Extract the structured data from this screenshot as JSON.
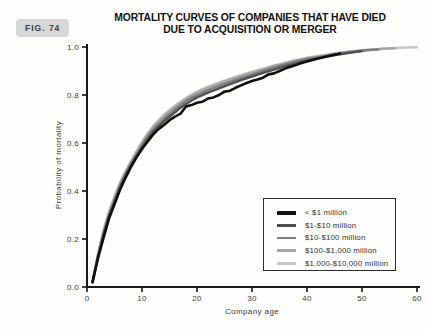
{
  "figure": {
    "badge": "FIG. 74"
  },
  "title": {
    "line1": "MORTALITY CURVES OF COMPANIES THAT HAVE DIED",
    "line2": "DUE TO ACQUISITION OR MERGER"
  },
  "chart_data": {
    "type": "line",
    "title": "MORTALITY CURVES OF COMPANIES THAT HAVE DIED DUE TO ACQUISITION OR MERGER",
    "xlabel": "Company age",
    "ylabel": "Probability of mortality",
    "xlim": [
      0,
      60
    ],
    "ylim": [
      0.0,
      1.0
    ],
    "x_ticks": [
      0,
      10,
      20,
      30,
      40,
      50,
      60
    ],
    "y_tick_labels": [
      "0.0",
      "0.2",
      "0.4",
      "0.6",
      "0.8",
      "1.0"
    ],
    "grid": false,
    "legend_position": "lower right",
    "axis_color": "#1a1a1a",
    "series": [
      {
        "name": "< $1 million",
        "color": "#101010",
        "line_width": 2.6,
        "points": [
          [
            1,
            0.02
          ],
          [
            2,
            0.12
          ],
          [
            3,
            0.205
          ],
          [
            4,
            0.285
          ],
          [
            5,
            0.345
          ],
          [
            6,
            0.405
          ],
          [
            7,
            0.455
          ],
          [
            8,
            0.5
          ],
          [
            9,
            0.54
          ],
          [
            10,
            0.575
          ],
          [
            11,
            0.605
          ],
          [
            12,
            0.635
          ],
          [
            13,
            0.658
          ],
          [
            14,
            0.675
          ],
          [
            15,
            0.695
          ],
          [
            16,
            0.71
          ],
          [
            17,
            0.722
          ],
          [
            18,
            0.752
          ],
          [
            19,
            0.758
          ],
          [
            20,
            0.768
          ],
          [
            21,
            0.772
          ],
          [
            22,
            0.785
          ],
          [
            23,
            0.79
          ],
          [
            24,
            0.8
          ],
          [
            25,
            0.814
          ],
          [
            26,
            0.818
          ],
          [
            27,
            0.83
          ],
          [
            28,
            0.84
          ],
          [
            29,
            0.85
          ],
          [
            30,
            0.858
          ],
          [
            31,
            0.864
          ],
          [
            32,
            0.872
          ],
          [
            33,
            0.886
          ],
          [
            34,
            0.89
          ],
          [
            35,
            0.9
          ],
          [
            36,
            0.91
          ],
          [
            37,
            0.918
          ],
          [
            38,
            0.925
          ],
          [
            39,
            0.933
          ],
          [
            40,
            0.94
          ],
          [
            41,
            0.946
          ],
          [
            42,
            0.952
          ],
          [
            43,
            0.957
          ],
          [
            44,
            0.962
          ],
          [
            45,
            0.968
          ],
          [
            46,
            0.973
          ]
        ]
      },
      {
        "name": "$1-$10 million",
        "color": "#4f4f4f",
        "line_width": 2.4,
        "points": [
          [
            1,
            0.02
          ],
          [
            2,
            0.125
          ],
          [
            3,
            0.215
          ],
          [
            4,
            0.295
          ],
          [
            5,
            0.355
          ],
          [
            6,
            0.415
          ],
          [
            7,
            0.465
          ],
          [
            8,
            0.508
          ],
          [
            9,
            0.546
          ],
          [
            10,
            0.582
          ],
          [
            11,
            0.615
          ],
          [
            12,
            0.645
          ],
          [
            13,
            0.668
          ],
          [
            14,
            0.69
          ],
          [
            15,
            0.71
          ],
          [
            16,
            0.728
          ],
          [
            17,
            0.747
          ],
          [
            18,
            0.763
          ],
          [
            19,
            0.777
          ],
          [
            20,
            0.79
          ],
          [
            22,
            0.81
          ],
          [
            24,
            0.828
          ],
          [
            26,
            0.845
          ],
          [
            28,
            0.862
          ],
          [
            30,
            0.877
          ],
          [
            32,
            0.892
          ],
          [
            34,
            0.906
          ],
          [
            36,
            0.92
          ],
          [
            38,
            0.932
          ],
          [
            40,
            0.943
          ],
          [
            42,
            0.953
          ],
          [
            44,
            0.962
          ],
          [
            46,
            0.97
          ],
          [
            48,
            0.977
          ],
          [
            50,
            0.983
          ]
        ]
      },
      {
        "name": "$10-$100 million",
        "color": "#7d7d7d",
        "line_width": 2.4,
        "points": [
          [
            1,
            0.02
          ],
          [
            2,
            0.13
          ],
          [
            3,
            0.225
          ],
          [
            4,
            0.3
          ],
          [
            5,
            0.36
          ],
          [
            6,
            0.42
          ],
          [
            7,
            0.47
          ],
          [
            8,
            0.512
          ],
          [
            9,
            0.552
          ],
          [
            10,
            0.59
          ],
          [
            11,
            0.625
          ],
          [
            12,
            0.655
          ],
          [
            13,
            0.678
          ],
          [
            14,
            0.7
          ],
          [
            15,
            0.72
          ],
          [
            16,
            0.74
          ],
          [
            17,
            0.758
          ],
          [
            18,
            0.775
          ],
          [
            19,
            0.788
          ],
          [
            20,
            0.8
          ],
          [
            22,
            0.82
          ],
          [
            24,
            0.838
          ],
          [
            26,
            0.855
          ],
          [
            28,
            0.87
          ],
          [
            30,
            0.885
          ],
          [
            32,
            0.9
          ],
          [
            34,
            0.915
          ],
          [
            36,
            0.928
          ],
          [
            38,
            0.94
          ],
          [
            40,
            0.95
          ],
          [
            42,
            0.958
          ],
          [
            44,
            0.965
          ],
          [
            46,
            0.972
          ],
          [
            48,
            0.978
          ],
          [
            50,
            0.984
          ],
          [
            52,
            0.988
          ],
          [
            53,
            0.99
          ]
        ]
      },
      {
        "name": "$100-$1,000 million",
        "color": "#a6a6a6",
        "line_width": 2.4,
        "points": [
          [
            1,
            0.02
          ],
          [
            2,
            0.135
          ],
          [
            3,
            0.23
          ],
          [
            4,
            0.31
          ],
          [
            5,
            0.372
          ],
          [
            6,
            0.43
          ],
          [
            7,
            0.478
          ],
          [
            8,
            0.52
          ],
          [
            9,
            0.56
          ],
          [
            10,
            0.6
          ],
          [
            11,
            0.634
          ],
          [
            12,
            0.665
          ],
          [
            13,
            0.69
          ],
          [
            14,
            0.712
          ],
          [
            15,
            0.732
          ],
          [
            16,
            0.75
          ],
          [
            17,
            0.767
          ],
          [
            18,
            0.783
          ],
          [
            19,
            0.797
          ],
          [
            20,
            0.81
          ],
          [
            22,
            0.83
          ],
          [
            24,
            0.848
          ],
          [
            26,
            0.864
          ],
          [
            28,
            0.879
          ],
          [
            30,
            0.893
          ],
          [
            32,
            0.907
          ],
          [
            34,
            0.92
          ],
          [
            36,
            0.932
          ],
          [
            38,
            0.943
          ],
          [
            40,
            0.953
          ],
          [
            42,
            0.961
          ],
          [
            44,
            0.968
          ],
          [
            46,
            0.975
          ],
          [
            48,
            0.981
          ],
          [
            50,
            0.986
          ],
          [
            52,
            0.99
          ],
          [
            54,
            0.993
          ],
          [
            56,
            0.995
          ]
        ]
      },
      {
        "name": "$1,000-$10,000 million",
        "color": "#c6c6c6",
        "line_width": 2.4,
        "points": [
          [
            1,
            0.02
          ],
          [
            2,
            0.14
          ],
          [
            3,
            0.238
          ],
          [
            4,
            0.315
          ],
          [
            5,
            0.378
          ],
          [
            6,
            0.435
          ],
          [
            7,
            0.483
          ],
          [
            8,
            0.525
          ],
          [
            9,
            0.566
          ],
          [
            10,
            0.605
          ],
          [
            11,
            0.64
          ],
          [
            12,
            0.67
          ],
          [
            13,
            0.695
          ],
          [
            14,
            0.718
          ],
          [
            15,
            0.738
          ],
          [
            16,
            0.755
          ],
          [
            17,
            0.772
          ],
          [
            18,
            0.788
          ],
          [
            19,
            0.802
          ],
          [
            20,
            0.815
          ],
          [
            22,
            0.835
          ],
          [
            24,
            0.852
          ],
          [
            26,
            0.868
          ],
          [
            28,
            0.883
          ],
          [
            30,
            0.897
          ],
          [
            32,
            0.91
          ],
          [
            34,
            0.923
          ],
          [
            36,
            0.935
          ],
          [
            38,
            0.946
          ],
          [
            40,
            0.955
          ],
          [
            42,
            0.963
          ],
          [
            44,
            0.97
          ],
          [
            46,
            0.977
          ],
          [
            48,
            0.982
          ],
          [
            50,
            0.987
          ],
          [
            52,
            0.99
          ],
          [
            54,
            0.993
          ],
          [
            56,
            0.996
          ],
          [
            58,
            0.998
          ],
          [
            60,
            0.999
          ]
        ]
      }
    ]
  }
}
